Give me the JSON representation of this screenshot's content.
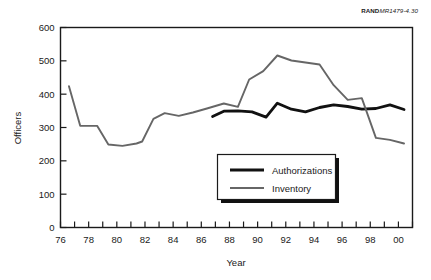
{
  "credit": {
    "bold_part": "RAND",
    "italic_part": "MR1479-4.30"
  },
  "chart_data": {
    "type": "line",
    "title": "",
    "xlabel": "Year",
    "ylabel": "Officers",
    "xlim": [
      1976,
      2001
    ],
    "ylim": [
      0,
      600
    ],
    "ytick_values": [
      0,
      100,
      200,
      300,
      400,
      500,
      600
    ],
    "ytick_labels": [
      "0",
      "100",
      "200",
      "300",
      "400",
      "500",
      "600"
    ],
    "xtick_values": [
      1976,
      1977,
      1978,
      1979,
      1980,
      1981,
      1982,
      1983,
      1984,
      1985,
      1986,
      1987,
      1988,
      1989,
      1990,
      1991,
      1992,
      1993,
      1994,
      1995,
      1996,
      1997,
      1998,
      1999,
      2000,
      2001
    ],
    "xtick_labels": [
      "76",
      "",
      "78",
      "",
      "80",
      "",
      "82",
      "",
      "84",
      "",
      "86",
      "",
      "88",
      "",
      "90",
      "",
      "92",
      "",
      "94",
      "",
      "96",
      "",
      "98",
      "",
      "00",
      ""
    ],
    "grid": false,
    "legend_position": "center",
    "series": [
      {
        "name": "Authorizations",
        "color": "#111111",
        "width": 2.8,
        "x": [
          1986.8,
          1987.6,
          1988.6,
          1989.6,
          1990.6,
          1991.4,
          1992.4,
          1993.4,
          1994.4,
          1995.4,
          1996.4,
          1997.4,
          1998.4,
          1999.4,
          2000.4
        ],
        "y": [
          333,
          349,
          350,
          347,
          331,
          373,
          355,
          347,
          360,
          368,
          363,
          355,
          357,
          368,
          354
        ]
      },
      {
        "name": "Inventory",
        "color": "#666666",
        "width": 1.9,
        "x": [
          1976.6,
          1977.4,
          1978.6,
          1979.4,
          1980.4,
          1981.4,
          1981.8,
          1982.6,
          1983.4,
          1984.4,
          1985.4,
          1986.4,
          1987.6,
          1988.6,
          1989.4,
          1990.4,
          1991.4,
          1992.4,
          1993.4,
          1994.4,
          1995.4,
          1996.4,
          1997.4,
          1998.4,
          1999.4,
          2000.4
        ],
        "y": [
          424,
          305,
          305,
          249,
          245,
          252,
          258,
          326,
          343,
          335,
          345,
          357,
          372,
          362,
          444,
          469,
          516,
          501,
          495,
          489,
          427,
          383,
          388,
          269,
          263,
          252
        ]
      }
    ],
    "legend_entries": [
      {
        "label": "Authorizations",
        "color": "#111111",
        "width": 2.8
      },
      {
        "label": "Inventory",
        "color": "#666666",
        "width": 1.9
      }
    ]
  }
}
